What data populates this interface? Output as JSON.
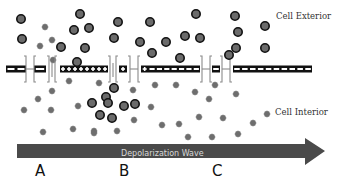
{
  "diagram": {
    "title": "",
    "labels": {
      "exterior": "Cell Exterior",
      "interior": "Cell Interior",
      "wave": "Depolarization Wave"
    },
    "stages": [
      "A",
      "B",
      "C"
    ],
    "colors": {
      "membrane": "#111111",
      "membrane_marks": "#ffffff",
      "channel": "#8a8a8a",
      "cation_fill": "#6b6b6b",
      "cation_stroke": "#111111",
      "anion": "#6e6e6e",
      "arrow": "#4a4a4a"
    },
    "membrane": {
      "y": 69,
      "segments": [
        {
          "x1": 6,
          "x2": 26,
          "charges": "--"
        },
        {
          "x1": 34,
          "x2": 46,
          "charges": "-"
        },
        {
          "x1": 60,
          "x2": 108,
          "charges": "++++++++"
        },
        {
          "x1": 119,
          "x2": 127,
          "charges": "+"
        },
        {
          "x1": 141,
          "x2": 200,
          "charges": "+-------"
        },
        {
          "x1": 212,
          "x2": 220,
          "charges": "-"
        },
        {
          "x1": 233,
          "x2": 312,
          "charges": "----------"
        }
      ],
      "channels": [
        {
          "x": 30,
          "state": "closed"
        },
        {
          "x": 52,
          "state": "open"
        },
        {
          "x": 113,
          "state": "open"
        },
        {
          "x": 134,
          "state": "closed"
        },
        {
          "x": 206,
          "state": "closed"
        },
        {
          "x": 226,
          "state": "closed"
        }
      ]
    },
    "cations": [
      [
        21,
        19
      ],
      [
        22,
        39
      ],
      [
        80,
        14
      ],
      [
        74,
        30
      ],
      [
        89,
        28
      ],
      [
        61,
        47
      ],
      [
        85,
        48
      ],
      [
        77,
        62
      ],
      [
        118,
        22
      ],
      [
        150,
        22
      ],
      [
        114,
        38
      ],
      [
        140,
        42
      ],
      [
        166,
        42
      ],
      [
        152,
        53
      ],
      [
        196,
        14
      ],
      [
        235,
        16
      ],
      [
        185,
        36
      ],
      [
        200,
        38
      ],
      [
        238,
        32
      ],
      [
        236,
        48
      ],
      [
        265,
        26
      ],
      [
        265,
        48
      ],
      [
        180,
        58
      ],
      [
        229,
        55
      ],
      [
        114,
        88
      ],
      [
        106,
        97
      ],
      [
        92,
        103
      ],
      [
        108,
        103
      ],
      [
        124,
        106
      ],
      [
        135,
        104
      ],
      [
        100,
        115
      ],
      [
        112,
        118
      ]
    ],
    "anions": [
      [
        45,
        27
      ],
      [
        40,
        46
      ],
      [
        52,
        40
      ],
      [
        53,
        60
      ],
      [
        69,
        81
      ],
      [
        52,
        91
      ],
      [
        38,
        99
      ],
      [
        24,
        110
      ],
      [
        51,
        110
      ],
      [
        78,
        106
      ],
      [
        43,
        132
      ],
      [
        73,
        129
      ],
      [
        94,
        131
      ],
      [
        99,
        83
      ],
      [
        133,
        90
      ],
      [
        155,
        85
      ],
      [
        176,
        85
      ],
      [
        134,
        120
      ],
      [
        151,
        107
      ],
      [
        162,
        125
      ],
      [
        179,
        124
      ],
      [
        117,
        131
      ],
      [
        94,
        133
      ],
      [
        188,
        137
      ],
      [
        215,
        85
      ],
      [
        195,
        92
      ],
      [
        209,
        99
      ],
      [
        236,
        94
      ],
      [
        267,
        114
      ],
      [
        199,
        117
      ],
      [
        223,
        118
      ],
      [
        253,
        123
      ],
      [
        212,
        137
      ],
      [
        238,
        134
      ],
      [
        260,
        150
      ]
    ]
  }
}
